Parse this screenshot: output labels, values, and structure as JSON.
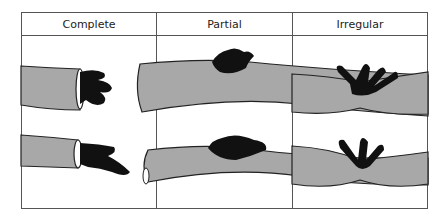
{
  "figure": {
    "columns": [
      {
        "label": "Complete"
      },
      {
        "label": "Partial"
      },
      {
        "label": "Irregular"
      }
    ],
    "colors": {
      "vessel": "#a8a8a8",
      "outline": "#222222",
      "extrusion": "#111111",
      "border": "#555555"
    }
  }
}
